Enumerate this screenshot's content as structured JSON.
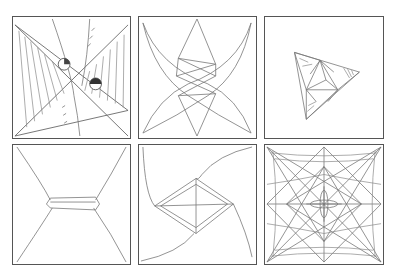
{
  "figure": {
    "panels": [
      {
        "id": "p1",
        "label": "hatched-bowtie-with-circles"
      },
      {
        "id": "p2",
        "label": "crossed-leaves-with-star"
      },
      {
        "id": "p3",
        "label": "triangular-fold-pattern"
      },
      {
        "id": "p4",
        "label": "hourglass-with-bar"
      },
      {
        "id": "p5",
        "label": "diamond-with-curves"
      },
      {
        "id": "p6",
        "label": "radial-star-grid"
      }
    ]
  },
  "colors": {
    "border": "#555555",
    "line": "#777777",
    "background": "#ffffff"
  }
}
